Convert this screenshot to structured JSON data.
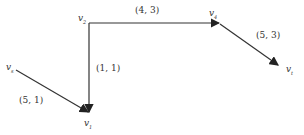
{
  "diagram": {
    "type": "directed-network",
    "nodes": [
      {
        "id": "vs",
        "label": "v",
        "sub": "s"
      },
      {
        "id": "v2",
        "label": "v",
        "sub": "2"
      },
      {
        "id": "v1",
        "label": "v",
        "sub": "1"
      },
      {
        "id": "v4",
        "label": "v",
        "sub": "4"
      },
      {
        "id": "vt",
        "label": "v",
        "sub": "t"
      }
    ],
    "edges": [
      {
        "from": "v2",
        "to": "v4",
        "label": "(4, 3)"
      },
      {
        "from": "v2",
        "to": "v1",
        "label": "(1, 1)"
      },
      {
        "from": "vs",
        "to": "v1",
        "label": "(5, 1)"
      },
      {
        "from": "v4",
        "to": "vt",
        "label": "(5, 3)"
      }
    ],
    "colors": {
      "line": "#333333",
      "text": "#333333"
    }
  }
}
